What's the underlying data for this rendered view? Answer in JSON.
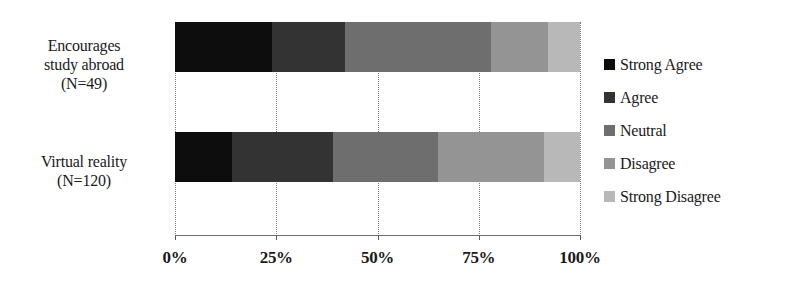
{
  "chart_data": {
    "type": "bar",
    "orientation": "horizontal",
    "stacked": true,
    "normalized_percent": true,
    "title": "",
    "xlabel": "",
    "ylabel": "",
    "xlim": [
      0,
      100
    ],
    "grid": true,
    "legend_position": "right",
    "categories": [
      "Encourages study abroad (N=49)",
      "Virtual reality (N=120)"
    ],
    "category_lines": [
      [
        "Encourages",
        "study abroad",
        "(N=49)"
      ],
      [
        "Virtual reality",
        "(N=120)"
      ]
    ],
    "xticks": [
      0,
      25,
      50,
      75,
      100
    ],
    "xtick_labels": [
      "0%",
      "25%",
      "50%",
      "75%",
      "100%"
    ],
    "series": [
      {
        "name": "Strong Agree",
        "color": "#0d0d0d",
        "values": [
          24,
          14
        ]
      },
      {
        "name": "Agree",
        "color": "#333333",
        "values": [
          18,
          25
        ]
      },
      {
        "name": "Neutral",
        "color": "#6e6e6e",
        "values": [
          36,
          26
        ]
      },
      {
        "name": "Disagree",
        "color": "#949494",
        "values": [
          14,
          26
        ]
      },
      {
        "name": "Strong Disagree",
        "color": "#b8b8b8",
        "values": [
          8,
          9
        ]
      }
    ]
  },
  "legend": {
    "items": [
      {
        "label": "Strong Agree"
      },
      {
        "label": "Agree"
      },
      {
        "label": "Neutral"
      },
      {
        "label": "Disagree"
      },
      {
        "label": "Strong Disagree"
      }
    ]
  }
}
